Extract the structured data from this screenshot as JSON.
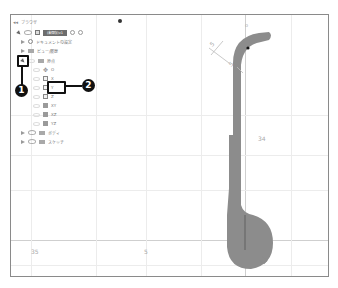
{
  "browser": {
    "title": "ブラウザ",
    "collapse_icon": "collapse-arrow-icon",
    "pin_icon": "pin-icon",
    "component": {
      "label": "(未保存)v1",
      "icons": [
        "eye-icon",
        "component-icon",
        "radio-icon",
        "target-icon"
      ]
    },
    "items": [
      {
        "label": "ドキュメントの設定",
        "icon": "gear-icon",
        "expanded": false
      },
      {
        "label": "ビュー/履歴",
        "icon": "folder-icon",
        "expanded": false
      },
      {
        "label": "原点",
        "icon": "folder-icon",
        "expanded": true,
        "children": [
          {
            "label": "O",
            "icon": "origin-point-icon"
          },
          {
            "label": "X",
            "icon": "axis-icon"
          },
          {
            "label": "Y",
            "icon": "axis-icon",
            "highlighted": true
          },
          {
            "label": "Z",
            "icon": "axis-icon"
          },
          {
            "label": "XY",
            "icon": "plane-icon"
          },
          {
            "label": "XZ",
            "icon": "plane-icon"
          },
          {
            "label": "YZ",
            "icon": "plane-icon"
          }
        ]
      },
      {
        "label": "ボディ",
        "icon": "folder-icon",
        "expanded": false
      },
      {
        "label": "スケッチ",
        "icon": "folder-icon",
        "expanded": false
      }
    ]
  },
  "callouts": [
    {
      "number": "1",
      "target": "expand-origin-toggle"
    },
    {
      "number": "2",
      "target": "origin-axis-y"
    }
  ],
  "canvas": {
    "dimension_labels": [
      "35",
      "5",
      "34"
    ],
    "shape_color": "#8c8c8c",
    "dimension_text_vertical": "5",
    "bg": "#ffffff"
  }
}
